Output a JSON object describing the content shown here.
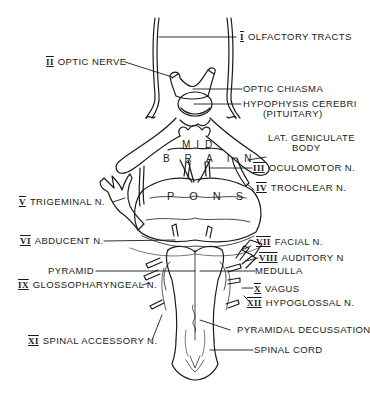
{
  "diagram": {
    "regions": {
      "midbrain_top": "MID",
      "midbrain_bottom": "B R A I N",
      "pons": "P O N S"
    },
    "labels": [
      {
        "id": "olfactory",
        "numeral": "I",
        "text": "OLFACTORY TRACTS",
        "side": "right"
      },
      {
        "id": "optic-nerve",
        "numeral": "II",
        "text": "OPTIC NERVE",
        "side": "left"
      },
      {
        "id": "optic-chiasma",
        "numeral": "",
        "text": "OPTIC CHIASMA",
        "side": "right"
      },
      {
        "id": "hypophysis",
        "numeral": "",
        "text": "HYPOPHYSIS CEREBRI",
        "text2": "(PITUITARY)",
        "side": "right"
      },
      {
        "id": "lat-geniculate",
        "numeral": "",
        "text": "LAT. GENICULATE",
        "text2": "BODY",
        "side": "right"
      },
      {
        "id": "oculomotor",
        "numeral": "III",
        "text": "OCULOMOTOR N.",
        "side": "right"
      },
      {
        "id": "trochlear",
        "numeral": "IV",
        "text": "TROCHLEAR N.",
        "side": "right"
      },
      {
        "id": "trigeminal",
        "numeral": "V",
        "text": "TRIGEMINAL N.",
        "side": "left"
      },
      {
        "id": "abducent",
        "numeral": "VI",
        "text": "ABDUCENT N.",
        "side": "left"
      },
      {
        "id": "facial",
        "numeral": "VII",
        "text": "FACIAL N.",
        "side": "right"
      },
      {
        "id": "auditory",
        "numeral": "VIII",
        "text": "AUDITORY N",
        "side": "right"
      },
      {
        "id": "pyramid",
        "numeral": "",
        "text": "PYRAMID",
        "side": "left"
      },
      {
        "id": "medulla",
        "numeral": "",
        "text": "MEDULLA",
        "side": "right"
      },
      {
        "id": "glossopharyngeal",
        "numeral": "IX",
        "text": "GLOSSOPHARYNGEAL N.",
        "side": "left"
      },
      {
        "id": "vagus",
        "numeral": "X",
        "text": "VAGUS",
        "side": "right"
      },
      {
        "id": "hypoglossal",
        "numeral": "XII",
        "text": "HYPOGLOSSAL N.",
        "side": "right"
      },
      {
        "id": "pyramidal-decussation",
        "numeral": "",
        "text": "PYRAMIDAL DECUSSATION",
        "side": "right"
      },
      {
        "id": "spinal-accessory",
        "numeral": "XI",
        "text": "SPINAL ACCESSORY N.",
        "side": "left"
      },
      {
        "id": "spinal-cord",
        "numeral": "",
        "text": "SPINAL CORD",
        "side": "right"
      }
    ],
    "colors": {
      "ink": "#1a1a1a",
      "background": "#ffffff"
    }
  }
}
